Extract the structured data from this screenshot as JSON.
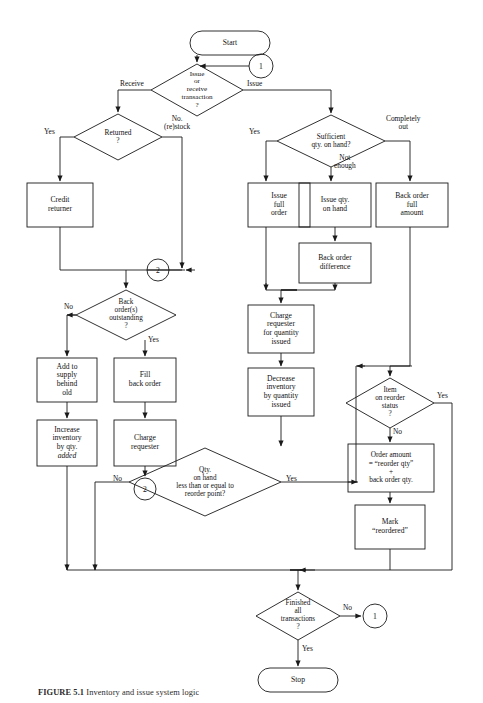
{
  "figure": {
    "caption_label": "FIGURE 5.1",
    "caption_text": "Inventory and issue system logic"
  },
  "diagram": {
    "type": "flowchart",
    "terminals": [
      {
        "id": "start",
        "label": "Start"
      },
      {
        "id": "stop",
        "label": "Stop"
      }
    ],
    "connectors": [
      {
        "id": "conn-1-top",
        "label": "1"
      },
      {
        "id": "conn-2-mid",
        "label": "2"
      },
      {
        "id": "conn-2-left",
        "label": "2"
      },
      {
        "id": "conn-1-bottom",
        "label": "1"
      }
    ],
    "decisions": [
      {
        "id": "issue-or-receive",
        "label": "Issue\nor\nreceive\ntransaction\n?"
      },
      {
        "id": "returned",
        "label": "Returned\n?"
      },
      {
        "id": "sufficient-qty",
        "label": "Sufficient\nqty. on hand?"
      },
      {
        "id": "back-orders-outstanding",
        "label": "Back\norder(s)\noutstanding\n?"
      },
      {
        "id": "qty-on-hand-reorder-point",
        "label": "Qty.\non hand\nless than or equal to\nreorder point?"
      },
      {
        "id": "item-on-reorder-status",
        "label": "Item\non reorder\nstatus\n?"
      },
      {
        "id": "finished-all-transactions",
        "label": "Finished\nall\ntransactions\n?"
      }
    ],
    "processes": [
      {
        "id": "credit-returner",
        "label": "Credit\nreturner"
      },
      {
        "id": "issue-full-order",
        "label": "Issue\nfull\norder"
      },
      {
        "id": "issue-qty-on-hand",
        "label": "Issue qty.\non hand"
      },
      {
        "id": "back-order-full-amount",
        "label": "Back order\nfull\namount"
      },
      {
        "id": "back-order-difference",
        "label": "Back order\ndifference"
      },
      {
        "id": "charge-requester-qty-issued",
        "label": "Charge\nrequester\nfor quantity\nissued"
      },
      {
        "id": "decrease-inventory",
        "label": "Decrease\ninventory\nby quantity\nissued"
      },
      {
        "id": "add-to-supply",
        "label": "Add to\nsupply\nbehind\nold"
      },
      {
        "id": "fill-back-order",
        "label": "Fill\nback order"
      },
      {
        "id": "increase-inventory",
        "label_line1": "Increase\ninventory\nby qty.",
        "label_line2": "added"
      },
      {
        "id": "charge-requester",
        "label": "Charge\nrequester"
      },
      {
        "id": "order-amount",
        "label": "Order amount\n= “reorder qty”\n+\nback order qty."
      },
      {
        "id": "mark-reordered",
        "label": "Mark\n“reordered”"
      }
    ],
    "edge_labels": [
      {
        "id": "label-receive",
        "text": "Receive"
      },
      {
        "id": "label-issue",
        "text": "Issue"
      },
      {
        "id": "label-returned-yes",
        "text": "Yes"
      },
      {
        "id": "label-no-restock",
        "text": "No.\n(re)stock"
      },
      {
        "id": "label-sufficient-yes",
        "text": "Yes"
      },
      {
        "id": "label-completely-out",
        "text": "Completely\nout"
      },
      {
        "id": "label-not-enough",
        "text": "Not\nenough"
      },
      {
        "id": "label-backorders-no",
        "text": "No"
      },
      {
        "id": "label-backorders-yes",
        "text": "Yes"
      },
      {
        "id": "label-qty-no",
        "text": "No"
      },
      {
        "id": "label-qty-yes",
        "text": "Yes"
      },
      {
        "id": "label-reorder-yes",
        "text": "Yes"
      },
      {
        "id": "label-reorder-no",
        "text": "No"
      },
      {
        "id": "label-finished-no",
        "text": "No"
      },
      {
        "id": "label-finished-yes",
        "text": "Yes"
      }
    ],
    "colors": {
      "stroke": "#1a1a1a",
      "background": "#ffffff",
      "text": "#111111"
    }
  }
}
